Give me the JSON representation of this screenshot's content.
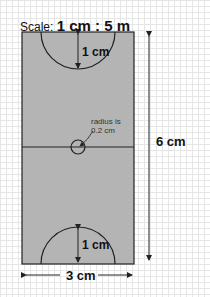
{
  "title": {
    "prefix": "Scale:",
    "ratio": "1 cm : 5 m"
  },
  "dimensions": {
    "top_arc": "1 cm",
    "bottom_arc": "1 cm",
    "height": "6 cm",
    "width": "3 cm"
  },
  "center_note": {
    "line1": "radius is",
    "line2": "0.2 cm"
  },
  "colors": {
    "court": "#b4b4b4",
    "line": "#222222",
    "grid": "#e6e6e6"
  }
}
